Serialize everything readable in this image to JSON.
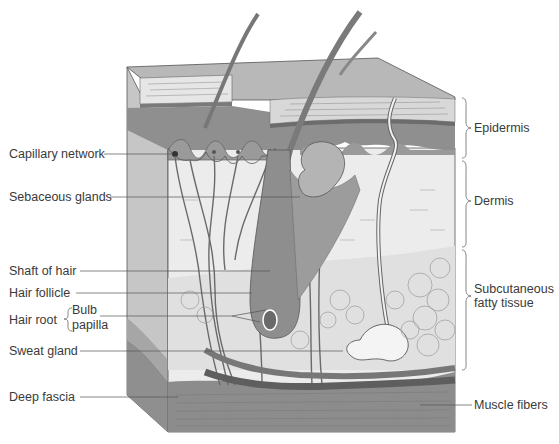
{
  "diagram": {
    "left_labels": [
      {
        "id": "capillary-network",
        "text": "Capillary network"
      },
      {
        "id": "sebaceous-glands",
        "text": "Sebaceous glands"
      },
      {
        "id": "shaft-of-hair",
        "text": "Shaft of hair"
      },
      {
        "id": "hair-follicle",
        "text": "Hair follicle"
      },
      {
        "id": "hair-root",
        "text": "Hair root"
      },
      {
        "id": "bulb",
        "text": "Bulb"
      },
      {
        "id": "papilla",
        "text": "papilla"
      },
      {
        "id": "sweat-gland",
        "text": "Sweat gland"
      },
      {
        "id": "deep-fascia",
        "text": "Deep fascia"
      }
    ],
    "right_labels": [
      {
        "id": "epidermis",
        "text": "Epidermis"
      },
      {
        "id": "dermis",
        "text": "Dermis"
      },
      {
        "id": "subcutaneous-line1",
        "text": "Subcutaneous"
      },
      {
        "id": "subcutaneous-line2",
        "text": "fatty tissue"
      },
      {
        "id": "muscle-fibers",
        "text": "Muscle fibers"
      }
    ],
    "colors": {
      "background": "#ffffff",
      "text": "#3a3a3a",
      "leader_line": "#555555",
      "epidermis_dark": "#8c8c8c",
      "stratum_light": "#d4d4d4",
      "dermis": "#ececec",
      "subcutaneous": "#e2e2e2",
      "muscle": "#8a8a8a",
      "vessel": "#6e6e6e",
      "side_face": "#c4c4c4"
    }
  }
}
